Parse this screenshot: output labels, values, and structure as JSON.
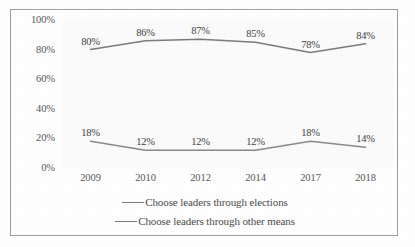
{
  "chart_data": {
    "type": "line",
    "title": "",
    "subtitle": "",
    "xlabel": "",
    "ylabel": "",
    "categories": [
      "2009",
      "2010",
      "2012",
      "2014",
      "2017",
      "2018"
    ],
    "series": [
      {
        "name": "Choose leaders through elections",
        "values": [
          80,
          86,
          87,
          85,
          78,
          84
        ],
        "labels": [
          "80%",
          "86%",
          "87%",
          "85%",
          "78%",
          "84%"
        ],
        "color": "#7b7b7b"
      },
      {
        "name": "Choose leaders through other means",
        "values": [
          18,
          12,
          12,
          12,
          18,
          14
        ],
        "labels": [
          "18%",
          "12%",
          "12%",
          "12%",
          "18%",
          "14%"
        ],
        "color": "#8a8a8a"
      }
    ],
    "ylim": [
      0,
      100
    ],
    "yticks": [
      0,
      20,
      40,
      60,
      80,
      100
    ],
    "ytick_labels": [
      "0%",
      "20%",
      "40%",
      "60%",
      "80%",
      "100%"
    ],
    "grid": false,
    "legend_position": "bottom",
    "frame": true
  },
  "legend": {
    "items": [
      {
        "label": "Choose leaders through elections"
      },
      {
        "label": "Choose leaders through other means"
      }
    ]
  }
}
